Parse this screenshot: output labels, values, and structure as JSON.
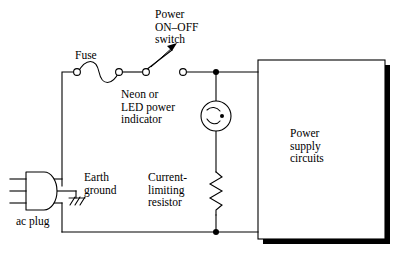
{
  "diagram": {
    "background_color": "#ffffff",
    "line_color": "#000000",
    "shadow_color": "#000000",
    "labels": {
      "power_switch": "Power\nON–OFF\nswitch",
      "fuse": "Fuse",
      "neon_indicator": "Neon or\nLED power\nindicator",
      "earth_ground": "Earth\nground",
      "current_limiting_resistor": "Current-\nlimiting\nresistor",
      "ac_plug": "ac plug",
      "power_supply_box": "Power\nsupply\ncircuits"
    },
    "components": [
      {
        "name": "ac-plug",
        "type": "plug",
        "prongs": 3
      },
      {
        "name": "earth-ground",
        "type": "ground",
        "hatch_lines": 3
      },
      {
        "name": "fuse",
        "type": "fuse",
        "terminals": 2
      },
      {
        "name": "power-switch",
        "type": "spst-switch",
        "state": "open"
      },
      {
        "name": "neon-lamp",
        "type": "neon-indicator"
      },
      {
        "name": "current-limiting-resistor",
        "type": "resistor",
        "zigzags": 6
      },
      {
        "name": "power-supply-circuits",
        "type": "block",
        "shadowed": true
      }
    ],
    "junctions": [
      {
        "name": "top-node",
        "x": 216,
        "y": 72
      },
      {
        "name": "bottom-node",
        "x": 216,
        "y": 232
      }
    ]
  }
}
